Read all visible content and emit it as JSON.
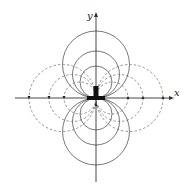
{
  "diagram": {
    "type": "magnetic-dipole-field",
    "axes": {
      "x_label": "x",
      "y_label": "y",
      "origin": [
        96,
        98
      ],
      "x_axis": [
        15,
        170
      ],
      "y_axis": [
        14,
        182
      ]
    },
    "radii": [
      16,
      23.5,
      33.5
    ],
    "solid_circles": "centered on y-axis, tangent at origin (field lines)",
    "dashed_circles": "centered on x-axis, tangent at origin (field lines)",
    "colors": {
      "solid": "#555555",
      "dashed": "#777777",
      "axis": "#333333",
      "magnet": "#111111"
    }
  }
}
